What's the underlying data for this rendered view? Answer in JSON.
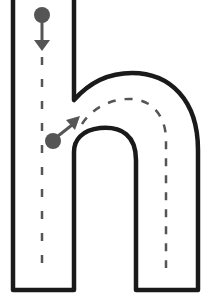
{
  "letter": "h",
  "colors": {
    "outline": "#1a1a1a",
    "guide": "#555555",
    "background": "#ffffff"
  },
  "strokes": [
    {
      "step": 1,
      "description": "Start at the dot and draw straight down",
      "icon": "start-dot-icon",
      "direction": "down-arrow-icon"
    },
    {
      "step": 2,
      "description": "Start at the dot, go up and over, then down",
      "icon": "start-dot-icon",
      "direction": "up-right-arrow-icon"
    }
  ]
}
